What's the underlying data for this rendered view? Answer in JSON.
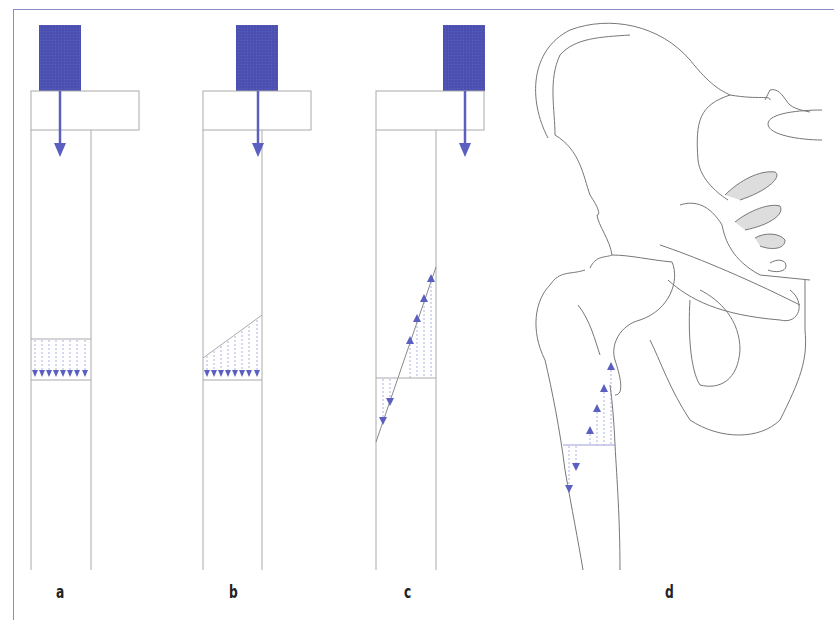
{
  "figure": {
    "panels": [
      {
        "id": "a",
        "label": "a",
        "description": "Axial load on column, uniform compressive stress distribution",
        "stress_pattern": "uniform-compression",
        "arrow_count": 8
      },
      {
        "id": "b",
        "label": "b",
        "description": "Eccentric load, trapezoidal compressive stress distribution",
        "stress_pattern": "trapezoidal-compression",
        "arrow_count": 8
      },
      {
        "id": "c",
        "label": "c",
        "description": "Highly eccentric load, bending stress: compression on one side, tension on other",
        "stress_pattern": "bending",
        "arrow_count": 6
      },
      {
        "id": "d",
        "label": "d",
        "description": "Proximal femur and pelvis with bending stress distribution in femoral shaft",
        "stress_pattern": "bending-femur",
        "arrow_count": 6
      }
    ],
    "colors": {
      "load_block": "#4a4fb0",
      "arrow": "#5a5fc0",
      "stress_arrow": "#7a7ed0",
      "outline": "#9a9a9a",
      "frame": "#8a8cc8",
      "label": "#222222"
    }
  }
}
